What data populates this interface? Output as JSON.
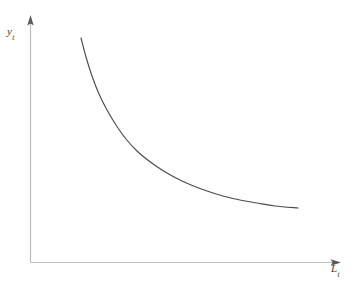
{
  "figure": {
    "background_color": "#ffffff",
    "width": 354,
    "height": 282,
    "top_clipped_text": "               ",
    "axis_color": "#bdbdbd",
    "arrow_color": "#55585c",
    "curve_color": "#4a4a4a"
  },
  "axes": {
    "y_axis": {
      "label_main": "y",
      "label_sub": "t",
      "name": "y-axis",
      "arrow": "up-arrowhead"
    },
    "x_axis": {
      "label_main": "L",
      "label_sub": "t",
      "name": "x-axis",
      "arrow": "right-arrowhead"
    }
  },
  "chart_data": {
    "type": "line",
    "title": "",
    "subtitle": "",
    "xlabel": "L_t",
    "ylabel": "y_t",
    "grid": false,
    "legend": null,
    "axis_arrows": true,
    "tick_labels": {
      "x": [],
      "y": []
    },
    "xlim": [
      0,
      1
    ],
    "ylim": [
      0,
      1
    ],
    "annotations": [],
    "series": [
      {
        "name": "per-worker output / labor demand curve",
        "shape": "convex decreasing hyperbola",
        "points_px": [
          [
            81,
            38
          ],
          [
            86,
            57
          ],
          [
            92,
            76
          ],
          [
            99,
            94
          ],
          [
            107,
            110
          ],
          [
            116,
            125
          ],
          [
            126,
            139
          ],
          [
            137,
            151
          ],
          [
            149,
            161
          ],
          [
            162,
            170
          ],
          [
            176,
            178
          ],
          [
            191,
            185
          ],
          [
            207,
            191
          ],
          [
            223,
            196
          ],
          [
            240,
            200
          ],
          [
            257,
            203
          ],
          [
            275,
            206
          ],
          [
            298,
            208
          ]
        ]
      }
    ]
  }
}
